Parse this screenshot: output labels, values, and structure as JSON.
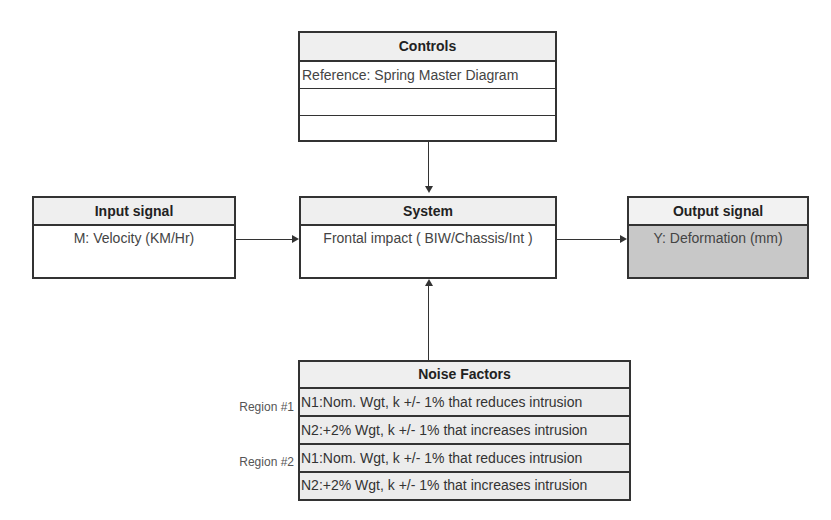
{
  "controls": {
    "title": "Controls",
    "rows": [
      "Reference: Spring Master Diagram",
      "",
      ""
    ]
  },
  "input_signal": {
    "title": "Input signal",
    "value": "M: Velocity (KM/Hr)"
  },
  "system": {
    "title": "System",
    "value": "Frontal impact ( BIW/Chassis/Int )"
  },
  "output_signal": {
    "title": "Output signal",
    "value": "Y: Deformation (mm)"
  },
  "noise_factors": {
    "title": "Noise Factors",
    "regions": [
      {
        "label": "Region #1",
        "rows": [
          "N1:Nom. Wgt, k +/- 1% that reduces intrusion",
          "N2:+2% Wgt, k +/- 1% that increases intrusion"
        ]
      },
      {
        "label": "Region #2",
        "rows": [
          "N1:Nom. Wgt, k +/- 1% that reduces intrusion",
          "N2:+2% Wgt, k +/- 1% that increases intrusion"
        ]
      }
    ]
  },
  "colors": {
    "output_fill": "#c8c8c8",
    "noise_fill": "#ececec",
    "header_fill": "#efefef",
    "border": "#333333"
  }
}
